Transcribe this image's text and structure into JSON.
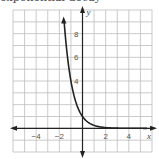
{
  "title": "exponential decay",
  "chart_data": {
    "type": "line",
    "title": "exponential decay",
    "xlabel": "x",
    "ylabel": "y",
    "xlim": [
      -6,
      6
    ],
    "ylim": [
      -2,
      10
    ],
    "grid": true,
    "x_ticks": [
      -4,
      -2,
      2,
      4
    ],
    "y_ticks": [
      4,
      6,
      8
    ],
    "x_tick_labels": [
      "−4",
      "−2",
      "2",
      "4"
    ],
    "y_tick_labels": [
      "4",
      "6",
      "8"
    ],
    "series": [
      {
        "name": "y = (1/4)^x",
        "x": [
          -1.6,
          -1.5,
          -1.25,
          -1,
          -0.75,
          -0.5,
          -0.25,
          0,
          0.5,
          1,
          1.5,
          2,
          3,
          4,
          5.5
        ],
        "y": [
          9.2,
          8.0,
          5.66,
          4.0,
          2.83,
          2.0,
          1.41,
          1.0,
          0.5,
          0.25,
          0.125,
          0.0625,
          0.016,
          0.004,
          0.0
        ]
      }
    ],
    "colors": {
      "curve": "#222222",
      "grid": "#bbbbbb",
      "axis": "#222222"
    }
  }
}
